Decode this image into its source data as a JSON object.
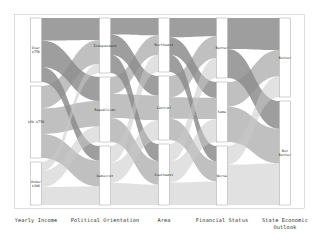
{
  "chart_data": {
    "type": "parallel-sets",
    "title": "",
    "subtitle": "",
    "xlabel": "",
    "ylabel": "",
    "grid": false,
    "legend": "none",
    "palette": {
      "ribbon_dark": "#4f4f4f",
      "ribbon_mid": "#8c8c8c",
      "ribbon_light": "#c9c9c9",
      "node_fill": "#ffffff",
      "node_stroke": "#8a8a8a",
      "frame": "#bdbdbd",
      "text": "#2b2b2b",
      "background": "#ffffff"
    },
    "dimensions": [
      {
        "id": "yearly_income",
        "axis_label": "Yearly Income",
        "x": 36,
        "categories": [
          {
            "label_lines": [
              "Over",
              "$75K"
            ],
            "label": "Over $75K",
            "value": 34,
            "y0": 18,
            "y1": 82
          },
          {
            "label_lines": [
              "$30-$75K"
            ],
            "label": "$30-$75K",
            "value": 42,
            "y0": 86,
            "y1": 158
          },
          {
            "label_lines": [
              "Under",
              "$30K"
            ],
            "label": "Under $30K",
            "value": 24,
            "y0": 162,
            "y1": 205
          }
        ]
      },
      {
        "id": "political_orientation",
        "axis_label": "Political Orientation",
        "x": 105,
        "categories": [
          {
            "label_lines": [
              "Independent"
            ],
            "label": "Independent",
            "value": 30,
            "y0": 18,
            "y1": 73
          },
          {
            "label_lines": [
              "Republican"
            ],
            "label": "Republican",
            "value": 38,
            "y0": 77,
            "y1": 142
          },
          {
            "label_lines": [
              "Democrat"
            ],
            "label": "Democrat",
            "value": 32,
            "y0": 146,
            "y1": 205
          }
        ]
      },
      {
        "id": "area",
        "axis_label": "Area",
        "x": 164,
        "categories": [
          {
            "label_lines": [
              "Northeast"
            ],
            "label": "Northeast",
            "value": 28,
            "y0": 18,
            "y1": 72
          },
          {
            "label_lines": [
              "Central"
            ],
            "label": "Central",
            "value": 36,
            "y0": 76,
            "y1": 140
          },
          {
            "label_lines": [
              "Southeast"
            ],
            "label": "Southeast",
            "value": 36,
            "y0": 144,
            "y1": 205
          }
        ]
      },
      {
        "id": "financial_status",
        "axis_label": "Financial Status",
        "x": 222,
        "categories": [
          {
            "label_lines": [
              "Better"
            ],
            "label": "Better",
            "value": 33,
            "y0": 18,
            "y1": 78
          },
          {
            "label_lines": [
              "Same"
            ],
            "label": "Same",
            "value": 34,
            "y0": 82,
            "y1": 142
          },
          {
            "label_lines": [
              "Worse"
            ],
            "label": "Worse",
            "value": 35,
            "y0": 146,
            "y1": 205
          }
        ]
      },
      {
        "id": "state_economic_outlook",
        "axis_label": "State Economic Outlook",
        "axis_label_lines": [
          "State Economic",
          "Outlook"
        ],
        "x": 285,
        "categories": [
          {
            "label_lines": [
              "Better"
            ],
            "label": "Better",
            "value": 42,
            "y0": 18,
            "y1": 97
          },
          {
            "label_lines": [
              "Not",
              "Better"
            ],
            "label": "Not Better",
            "value": 58,
            "y0": 101,
            "y1": 205
          }
        ]
      }
    ],
    "flows": [
      {
        "from": "yearly_income",
        "from_cat": 0,
        "to": "political_orientation",
        "to_cat": 0,
        "value": 12
      },
      {
        "from": "yearly_income",
        "from_cat": 0,
        "to": "political_orientation",
        "to_cat": 1,
        "value": 14
      },
      {
        "from": "yearly_income",
        "from_cat": 0,
        "to": "political_orientation",
        "to_cat": 2,
        "value": 8
      },
      {
        "from": "yearly_income",
        "from_cat": 1,
        "to": "political_orientation",
        "to_cat": 0,
        "value": 13
      },
      {
        "from": "yearly_income",
        "from_cat": 1,
        "to": "political_orientation",
        "to_cat": 1,
        "value": 15
      },
      {
        "from": "yearly_income",
        "from_cat": 1,
        "to": "political_orientation",
        "to_cat": 2,
        "value": 14
      },
      {
        "from": "yearly_income",
        "from_cat": 2,
        "to": "political_orientation",
        "to_cat": 0,
        "value": 5
      },
      {
        "from": "yearly_income",
        "from_cat": 2,
        "to": "political_orientation",
        "to_cat": 1,
        "value": 9
      },
      {
        "from": "yearly_income",
        "from_cat": 2,
        "to": "political_orientation",
        "to_cat": 2,
        "value": 10
      },
      {
        "from": "political_orientation",
        "from_cat": 0,
        "to": "area",
        "to_cat": 0,
        "value": 9
      },
      {
        "from": "political_orientation",
        "from_cat": 0,
        "to": "area",
        "to_cat": 1,
        "value": 11
      },
      {
        "from": "political_orientation",
        "from_cat": 0,
        "to": "area",
        "to_cat": 2,
        "value": 10
      },
      {
        "from": "political_orientation",
        "from_cat": 1,
        "to": "area",
        "to_cat": 0,
        "value": 10
      },
      {
        "from": "political_orientation",
        "from_cat": 1,
        "to": "area",
        "to_cat": 1,
        "value": 14
      },
      {
        "from": "political_orientation",
        "from_cat": 1,
        "to": "area",
        "to_cat": 2,
        "value": 14
      },
      {
        "from": "political_orientation",
        "from_cat": 2,
        "to": "area",
        "to_cat": 0,
        "value": 9
      },
      {
        "from": "political_orientation",
        "from_cat": 2,
        "to": "area",
        "to_cat": 1,
        "value": 11
      },
      {
        "from": "political_orientation",
        "from_cat": 2,
        "to": "area",
        "to_cat": 2,
        "value": 12
      },
      {
        "from": "area",
        "from_cat": 0,
        "to": "financial_status",
        "to_cat": 0,
        "value": 10
      },
      {
        "from": "area",
        "from_cat": 0,
        "to": "financial_status",
        "to_cat": 1,
        "value": 9
      },
      {
        "from": "area",
        "from_cat": 0,
        "to": "financial_status",
        "to_cat": 2,
        "value": 9
      },
      {
        "from": "area",
        "from_cat": 1,
        "to": "financial_status",
        "to_cat": 0,
        "value": 12
      },
      {
        "from": "area",
        "from_cat": 1,
        "to": "financial_status",
        "to_cat": 1,
        "value": 12
      },
      {
        "from": "area",
        "from_cat": 1,
        "to": "financial_status",
        "to_cat": 2,
        "value": 12
      },
      {
        "from": "area",
        "from_cat": 2,
        "to": "financial_status",
        "to_cat": 0,
        "value": 11
      },
      {
        "from": "area",
        "from_cat": 2,
        "to": "financial_status",
        "to_cat": 1,
        "value": 13
      },
      {
        "from": "area",
        "from_cat": 2,
        "to": "financial_status",
        "to_cat": 2,
        "value": 14
      },
      {
        "from": "financial_status",
        "from_cat": 0,
        "to": "state_economic_outlook",
        "to_cat": 0,
        "value": 17
      },
      {
        "from": "financial_status",
        "from_cat": 0,
        "to": "state_economic_outlook",
        "to_cat": 1,
        "value": 16
      },
      {
        "from": "financial_status",
        "from_cat": 1,
        "to": "state_economic_outlook",
        "to_cat": 0,
        "value": 14
      },
      {
        "from": "financial_status",
        "from_cat": 1,
        "to": "state_economic_outlook",
        "to_cat": 1,
        "value": 20
      },
      {
        "from": "financial_status",
        "from_cat": 2,
        "to": "state_economic_outlook",
        "to_cat": 0,
        "value": 11
      },
      {
        "from": "financial_status",
        "from_cat": 2,
        "to": "state_economic_outlook",
        "to_cat": 1,
        "value": 24
      }
    ]
  }
}
